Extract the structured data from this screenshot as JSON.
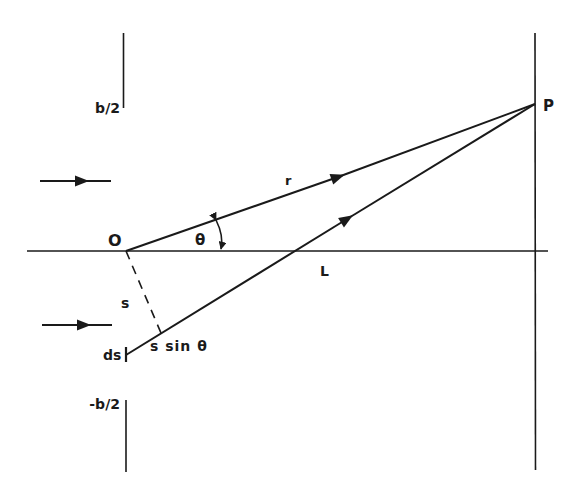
{
  "figure": {
    "type": "single-slit-diffraction-geometry",
    "colors": {
      "ink": "#1a1a1a",
      "background": "#ffffff"
    },
    "labels": {
      "slit_top": "b/2",
      "slit_bottom": "-b/2",
      "origin": "O",
      "point": "P",
      "ray_distance": "r",
      "angle": "θ",
      "axis_point": "L",
      "element_offset": "s",
      "element_width": "ds",
      "path_difference": "s sin θ"
    },
    "elements": [
      "incident-wave-arrow-upper",
      "incident-wave-arrow-lower",
      "slit-edge-top",
      "slit-edge-bottom",
      "optical-axis",
      "observation-screen",
      "ray-r-from-O-to-P",
      "ray-from-ds-to-P",
      "perpendicular-dashed-line",
      "angle-arc-theta"
    ]
  }
}
